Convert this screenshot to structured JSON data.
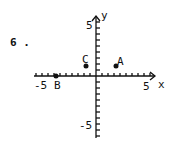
{
  "problem_number": "6 .",
  "chart_data": {
    "type": "scatter",
    "title": "",
    "xlabel": "x",
    "ylabel": "y",
    "xlim": [
      -6,
      6
    ],
    "ylim": [
      -6,
      6
    ],
    "x_tick_labels": [
      "-5",
      "5"
    ],
    "y_tick_labels": [
      "5",
      "-5"
    ],
    "grid": false,
    "points": [
      {
        "label": "A",
        "x": 2,
        "y": 1
      },
      {
        "label": "B",
        "x": -4,
        "y": 0
      },
      {
        "label": "C",
        "x": -1,
        "y": 1
      }
    ]
  },
  "labels": {
    "x_axis": "x",
    "y_axis": "y",
    "x_neg5": "-5",
    "x_pos5": "5",
    "y_pos5": "5",
    "y_neg5": "-5",
    "point_a": "A",
    "point_b": "B",
    "point_c": "C"
  }
}
